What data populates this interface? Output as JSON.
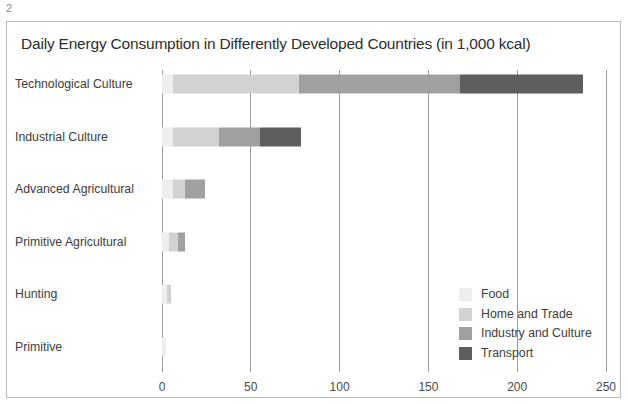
{
  "page": {
    "number": "2"
  },
  "figure": {
    "title": "Daily Energy Consumption in Differently Developed Countries (in 1,000 kcal)"
  },
  "chart_data": {
    "type": "bar",
    "orientation": "horizontal",
    "stacked": true,
    "title": "Daily Energy Consumption in Differently Developed Countries (in 1,000 kcal)",
    "xlabel": "",
    "ylabel": "",
    "xlim": [
      0,
      250
    ],
    "xticks": [
      0,
      50,
      100,
      150,
      200,
      250
    ],
    "xtick_labels": [
      "0",
      "50",
      "100",
      "150",
      "200",
      "250"
    ],
    "grid": true,
    "grid_axis": "x",
    "legend_position": "inside-lower-right",
    "categories": [
      "Technological Culture",
      "Industrial Culture",
      "Advanced Agricultural",
      "Primitive Agricultural",
      "Hunting",
      "Primitive"
    ],
    "series": [
      {
        "name": "Food",
        "color": "#eeeeee",
        "values": [
          6,
          6,
          6,
          4,
          3,
          2
        ]
      },
      {
        "name": "Home and Trade",
        "color": "#d2d2d2",
        "values": [
          71,
          26,
          7,
          5,
          2,
          0
        ]
      },
      {
        "name": "Industry and Culture",
        "color": "#a0a0a0",
        "values": [
          91,
          23,
          11,
          4,
          0,
          0
        ]
      },
      {
        "name": "Transport",
        "color": "#5e5e5e",
        "values": [
          69,
          23,
          0,
          0,
          0,
          0
        ]
      }
    ],
    "totals": [
      237,
      78,
      24,
      13,
      5,
      2
    ]
  },
  "legend": {
    "items": [
      {
        "label": "Food",
        "color": "#eeeeee"
      },
      {
        "label": "Home and Trade",
        "color": "#d2d2d2"
      },
      {
        "label": "Industry and Culture",
        "color": "#a0a0a0"
      },
      {
        "label": "Transport",
        "color": "#5e5e5e"
      }
    ]
  }
}
